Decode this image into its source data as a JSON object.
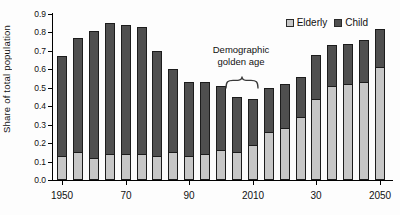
{
  "figure": {
    "y_axis_title": "Share of total population",
    "annotation": {
      "line1": "Demographic",
      "line2": "golden age"
    },
    "colors": {
      "elderly": "#c7c7c7",
      "child": "#4f4f4f",
      "bar_border": "#1c1c1c",
      "axis": "#000000",
      "text": "#111111",
      "background": "#fdfdfd"
    }
  },
  "chart_data": {
    "type": "bar",
    "stacked": true,
    "title": "",
    "xlabel": "",
    "ylabel": "Share of total population",
    "ylim": [
      0,
      0.9
    ],
    "grid": false,
    "legend_position": "top-right",
    "categories": [
      1950,
      1955,
      1960,
      1965,
      1970,
      1975,
      1980,
      1985,
      1990,
      1995,
      2000,
      2005,
      2010,
      2015,
      2020,
      2025,
      2030,
      2035,
      2040,
      2045,
      2050
    ],
    "series": [
      {
        "name": "Elderly",
        "color": "#c7c7c7",
        "values": [
          0.13,
          0.15,
          0.12,
          0.14,
          0.14,
          0.14,
          0.13,
          0.15,
          0.13,
          0.14,
          0.16,
          0.15,
          0.19,
          0.26,
          0.28,
          0.34,
          0.44,
          0.51,
          0.52,
          0.53,
          0.61
        ]
      },
      {
        "name": "Child",
        "color": "#4f4f4f",
        "values": [
          0.54,
          0.62,
          0.69,
          0.71,
          0.7,
          0.69,
          0.57,
          0.45,
          0.4,
          0.39,
          0.35,
          0.3,
          0.25,
          0.24,
          0.24,
          0.22,
          0.24,
          0.22,
          0.22,
          0.23,
          0.21
        ]
      }
    ],
    "totals": [
      0.67,
      0.77,
      0.81,
      0.85,
      0.84,
      0.83,
      0.7,
      0.6,
      0.53,
      0.53,
      0.51,
      0.45,
      0.44,
      0.5,
      0.52,
      0.56,
      0.68,
      0.73,
      0.74,
      0.76,
      0.82
    ],
    "y_tick_labels": [
      "0.0",
      "0.1",
      "0.2",
      "0.3",
      "0.4",
      "0.5",
      "0.6",
      "0.7",
      "0.8",
      "0.9"
    ],
    "x_tick_marks": [
      {
        "index": 0,
        "label": "1950"
      },
      {
        "index": 4,
        "label": "70"
      },
      {
        "index": 8,
        "label": "90"
      },
      {
        "index": 12,
        "label": "2010"
      },
      {
        "index": 16,
        "label": "30"
      },
      {
        "index": 20,
        "label": "2050"
      }
    ],
    "annotation": {
      "text": "Demographic golden age",
      "target_years": [
        2005,
        2010
      ]
    }
  }
}
